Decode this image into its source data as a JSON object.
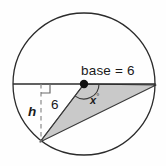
{
  "figure": {
    "background_color": "#fefefe",
    "stroke_color": "#2b2b2b",
    "fill_color": "#c9c9c9",
    "dash_color": "#8a8a8a"
  },
  "labels": {
    "base": "base = 6",
    "side": "6",
    "height": "h",
    "angle": "x",
    "angle_degree_symbol": "°"
  },
  "geometry": {
    "circle": {
      "cx": 84,
      "cy": 84,
      "r": 71
    },
    "center_dot": {
      "cx": 84,
      "cy": 84,
      "r": 4
    },
    "diameter": {
      "x1": 13,
      "y1": 84,
      "x2": 155,
      "y2": 84
    },
    "triangle_vertices": [
      {
        "x": 84,
        "y": 84
      },
      {
        "x": 156,
        "y": 85
      },
      {
        "x": 40,
        "y": 142
      }
    ],
    "height_line": {
      "x1": 41,
      "y1": 84,
      "x2": 41,
      "y2": 142
    },
    "right_angle_marker": {
      "x": 41,
      "y": 84,
      "size": 9
    },
    "angle_arc": {
      "cx": 84,
      "cy": 84,
      "r": 15
    }
  }
}
